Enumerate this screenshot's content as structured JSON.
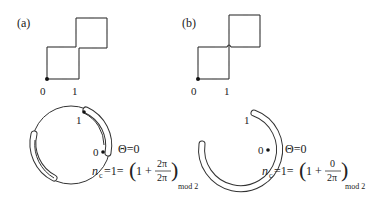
{
  "panels": [
    {
      "id": "a",
      "label": "(a)",
      "lattice_labels": [
        "0",
        "1"
      ],
      "circle_labels": [
        "1",
        "0"
      ],
      "theta": "Θ=0",
      "formula": {
        "lhs": "n",
        "lhs_sub": "c",
        "eq": "=1=",
        "one_plus": "1 +",
        "num": "2π",
        "den": "2π",
        "sub": "mod 2"
      }
    },
    {
      "id": "b",
      "label": "(b)",
      "lattice_labels": [
        "0",
        "1"
      ],
      "circle_labels": [
        "1",
        "0"
      ],
      "theta": "Θ=0",
      "formula": {
        "lhs": "n",
        "lhs_sub": "c",
        "eq": "=1=",
        "one_plus": "1 +",
        "num": "0",
        "den": "2π",
        "sub": "mod 2"
      }
    }
  ],
  "colors": {
    "line": "#333333",
    "text": "#222222",
    "background": "#ffffff"
  }
}
